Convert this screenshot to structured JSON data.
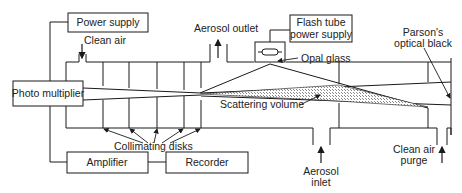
{
  "diagram": {
    "boxes": {
      "power_supply": "Power supply",
      "photo_multiplier": "Photo multiplier",
      "amplifier": "Amplifier",
      "recorder": "Recorder",
      "flash_tube_line1": "Flash tube",
      "flash_tube_line2": "power supply"
    },
    "labels": {
      "clean_air": "Clean air",
      "aerosol_outlet": "Aerosol outlet",
      "opal_glass": "Opal glass",
      "parsons_line1": "Parson's",
      "parsons_line2": "optical black",
      "scattering_volume": "Scattering volume",
      "collimating_disks": "Collimating disks",
      "aerosol_inlet_line1": "Aerosol",
      "aerosol_inlet_line2": "inlet",
      "clean_air_purge_line1": "Clean air",
      "clean_air_purge_line2": "purge"
    },
    "colors": {
      "line": "#1a1a1a",
      "text": "#222222",
      "hatch": "#9a9a9a"
    }
  }
}
